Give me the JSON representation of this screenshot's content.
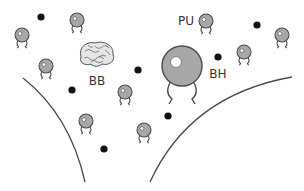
{
  "diagram": {
    "labels": {
      "brain": "BB",
      "pu": "PU",
      "black_hole": "BH"
    },
    "colors": {
      "background": "#ffffff",
      "blob_fill": "#a8a8a8",
      "blob_stroke": "#4a4a4a",
      "highlight": "#ffffff",
      "dot": "#111111",
      "curve": "#4a4a4a",
      "brain_fill": "#e6e6e6",
      "brain_stroke": "#555555",
      "label": "#333333"
    },
    "dots": [
      {
        "x": 41,
        "y": 17
      },
      {
        "x": 138,
        "y": 70
      },
      {
        "x": 257,
        "y": 25
      },
      {
        "x": 218,
        "y": 57
      },
      {
        "x": 72,
        "y": 90
      },
      {
        "x": 168,
        "y": 116
      },
      {
        "x": 104,
        "y": 149
      }
    ],
    "small_blobs": [
      {
        "x": 22,
        "y": 35
      },
      {
        "x": 77,
        "y": 20
      },
      {
        "x": 206,
        "y": 21
      },
      {
        "x": 282,
        "y": 35
      },
      {
        "x": 46,
        "y": 66
      },
      {
        "x": 244,
        "y": 52
      },
      {
        "x": 125,
        "y": 92
      },
      {
        "x": 86,
        "y": 121
      },
      {
        "x": 144,
        "y": 130
      }
    ],
    "big_blob": {
      "x": 182,
      "y": 66,
      "r": 20
    },
    "brain": {
      "x": 97,
      "y": 55
    },
    "curves": [
      {
        "name": "left",
        "d": "M23 78 Q70 115 85 182"
      },
      {
        "name": "right",
        "d": "M150 182 Q190 95 292 77"
      }
    ]
  }
}
